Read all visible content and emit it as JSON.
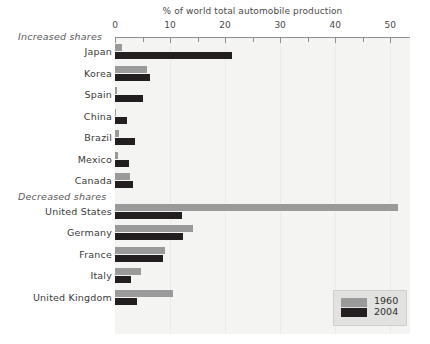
{
  "chart_data": {
    "type": "bar",
    "orientation": "horizontal",
    "title": "% of world total automobile production",
    "xlabel": "",
    "ylabel": "",
    "xlim": [
      0,
      53.6
    ],
    "grid": true,
    "legend_position": "bottom-right",
    "tick_labels": [
      "0",
      "10",
      "20",
      "30",
      "40",
      "50"
    ],
    "tick_values": [
      0,
      10,
      20,
      30,
      40,
      50
    ],
    "minor_tick_values": [
      5,
      15,
      25,
      35,
      45
    ],
    "sections": [
      {
        "label": "Increased shares",
        "categories": [
          "Japan",
          "Korea",
          "Spain",
          "China",
          "Brazil",
          "Mexico",
          "Canada"
        ]
      },
      {
        "label": "Decreased shares",
        "categories": [
          "United States",
          "Germany",
          "France",
          "Italy",
          "United Kingdom"
        ]
      }
    ],
    "categories": [
      "Japan",
      "Korea",
      "Spain",
      "China",
      "Brazil",
      "Mexico",
      "Canada",
      "United States",
      "Germany",
      "France",
      "Italy",
      "United Kingdom"
    ],
    "series": [
      {
        "name": "1960",
        "color": "#9a9a9a",
        "values": [
          1.3,
          5.9,
          0.4,
          0.2,
          0.8,
          0.5,
          2.8,
          51.5,
          14.2,
          9.0,
          4.7,
          10.5
        ]
      },
      {
        "name": "2004",
        "color": "#231f20",
        "values": [
          21.2,
          6.4,
          5.1,
          2.2,
          3.6,
          2.5,
          3.2,
          12.2,
          12.4,
          8.7,
          2.9,
          4.0
        ]
      }
    ]
  },
  "legend": {
    "entries": [
      {
        "label": "1960",
        "color": "#9a9a9a"
      },
      {
        "label": "2004",
        "color": "#231f20"
      }
    ]
  },
  "colors": {
    "series_1960": "#9a9a9a",
    "series_2004": "#231f20",
    "plot_background": "#f4f4f2",
    "gridline": "#ebebe8",
    "axis": "#8e8e8e",
    "text": "#3a3a3a",
    "legend_background": "#e2e2e0"
  }
}
